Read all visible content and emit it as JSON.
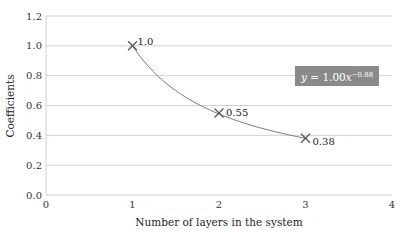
{
  "chart_data": {
    "type": "scatter",
    "title": "",
    "xlabel": "Number of layers in the system",
    "ylabel": "Coefficients",
    "xlim": [
      0,
      4
    ],
    "ylim": [
      0,
      1.2
    ],
    "x_ticks": [
      "0",
      "1",
      "2",
      "3",
      "4"
    ],
    "y_ticks": [
      "0.0",
      "0.2",
      "0.4",
      "0.6",
      "0.8",
      "1.0",
      "1.2"
    ],
    "grid": "horizontal",
    "series": [
      {
        "name": "Coefficients",
        "marker": "x",
        "x": [
          1,
          2,
          3
        ],
        "y": [
          1.0,
          0.55,
          0.38
        ],
        "labels": [
          "1.0",
          "0.55",
          "0.38"
        ]
      }
    ],
    "trendline": {
      "type": "power",
      "a": 1.0,
      "b": -0.88,
      "equation_prefix": "y = 1.00x",
      "equation_exponent": "−0.88"
    },
    "colors": {
      "grid": "#d0d0d0",
      "curve": "#7a7a7a",
      "marker": "#555555",
      "equation_box": "#8a8a8a"
    }
  }
}
